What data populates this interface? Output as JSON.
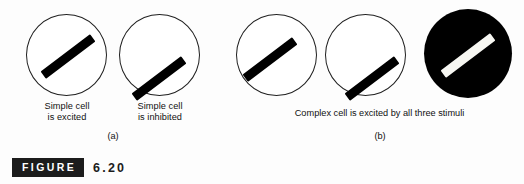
{
  "figure": {
    "badge_label": "FIGURE",
    "number": "6.20"
  },
  "panels": [
    {
      "letter": "(a)",
      "stimuli": [
        {
          "name": "simple-cell-excited",
          "circle_style": "outline",
          "bar_color": "#000000",
          "bar_angle_deg": -37,
          "caption_line1": "Simple cell",
          "caption_line2": "is excited"
        },
        {
          "name": "simple-cell-inhibited",
          "circle_style": "outline",
          "bar_color": "#000000",
          "bar_angle_deg": -37,
          "caption_line1": "Simple cell",
          "caption_line2": "is inhibited"
        }
      ]
    },
    {
      "letter": "(b)",
      "group_caption": "Complex cell is excited by all three stimuli",
      "stimuli": [
        {
          "name": "complex-stimulus-centered",
          "circle_style": "outline",
          "bar_color": "#000000",
          "bar_angle_deg": -37,
          "caption_line1": "",
          "caption_line2": ""
        },
        {
          "name": "complex-stimulus-offset",
          "circle_style": "outline",
          "bar_color": "#000000",
          "bar_angle_deg": -37,
          "caption_line1": "",
          "caption_line2": ""
        },
        {
          "name": "complex-stimulus-inverted",
          "circle_style": "filled",
          "bar_color": "#f7f7f2",
          "bar_angle_deg": -37,
          "caption_line1": "",
          "caption_line2": ""
        }
      ]
    }
  ],
  "colors": {
    "background": "#fdfdfd",
    "stroke": "#202020",
    "bar_dark": "#000000",
    "bar_light": "#f7f7f2",
    "badge_background": "#1c1c1c",
    "badge_text": "#ffffff"
  }
}
